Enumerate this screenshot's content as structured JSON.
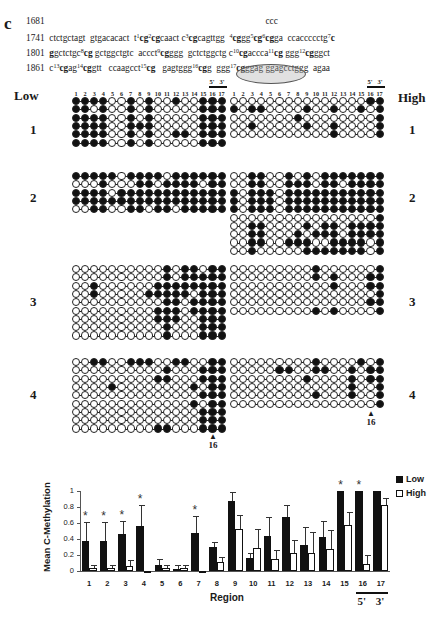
{
  "panel_letter": "c",
  "sequence": {
    "lines": [
      {
        "pos": "1681",
        "html": "                                                                                             ccc"
      },
      {
        "pos": "1741",
        "html": "ctctgctagt  gtgacacact  t<sup>1</sup><b>cg</b><sup>2</sup><b>cg</b>caact c<sup>3</sup><b>cg</b>cagttgg  <sup>4</sup><b>cg</b>gg<sup>5</sup><b>cg</b><sup>6</sup><b>cg</b>ga  ccaccccctg<sup>7</sup><b>c</b>"
      },
      {
        "pos": "1801",
        "html": "<b>g</b>gctctgc<sup>8</sup><b>cg</b> gctggctgtc  accct<sup>9</sup><b>cg</b>ggg  gctctggctg c<sup>10</sup><b>cg</b>accca<sup>11</sup><b>cg</b> ggg<sup>12</sup><b>cg</b>ggct"
      },
      {
        "pos": "1861",
        "html": "c<sup>13</sup><b>cg</b>ag<sup>14</sup><b>cg</b>gtt   ccaagcct<sup>15</sup><b>cg</b>   gagtggg<sup>16</sup><b>cg</b>g  ggg<sup>17</sup><b>cg</b>ggag ggagcctggg  agaa"
      }
    ]
  },
  "labels": {
    "low": "Low",
    "high": "High",
    "five_prime": "5'",
    "three_prime": "3'",
    "arrow_label": "16",
    "arrow": "▲"
  },
  "cpg_numbers": [
    "1",
    "2",
    "3",
    "4",
    "5",
    "6",
    "7",
    "8",
    "9",
    "10",
    "11",
    "12",
    "13",
    "14",
    "15",
    "16",
    "17"
  ],
  "groups": [
    {
      "id": "1",
      "low": [
        "11110010100100111",
        "11010010100000111",
        "11110010100000111",
        "11110011100000111",
        "11110010100110111",
        "11110010100000111"
      ],
      "high": [
        "00000000000000011",
        "10110000100100101",
        "00000001000000001",
        "00100000100100001",
        "00000000000100001"
      ]
    },
    {
      "id": "2",
      "low": [
        "11111011110111111",
        "00010001101111011",
        "11110111111111111",
        "11111111111111111",
        "00110011011011111"
      ],
      "high": [
        "00110010101111111",
        "00110011101101111",
        "10111011111111111",
        "10111011111111111",
        "10111011111111111",
        "00000000000000001",
        "00110000101101111",
        "00110001011101111",
        "00110011100111101",
        "00100000111111101"
      ]
    },
    {
      "id": "3",
      "low": [
        "00000000001011011",
        "00000000001011111",
        "00100000011111111",
        "00100000111110111",
        "00000000001101111",
        "00000000011101111",
        "00000000011100111",
        "00000000001000111",
        "00000000001000111"
      ],
      "high": [
        "00000000010000001",
        "00000000010100011",
        "00000000000100011",
        "00000000000000001",
        "00000000000000011",
        "00000000010100001"
      ]
    },
    {
      "id": "4",
      "low": [
        "00110011100110011",
        "00000000001000111",
        "00000000011000111",
        "00001000000001011",
        "00000000000000111",
        "00000000000001011",
        "00000000000000111",
        "00000000000000111",
        "00000000011000111"
      ],
      "high": [
        "00000000010000101",
        "00000110011001011",
        "00000000100001011",
        "00000000000001001",
        "00000000010001001",
        "00000000000000001"
      ]
    }
  ],
  "chart_data": {
    "type": "bar",
    "title": "",
    "xlabel": "Region",
    "ylabel": "Mean C-Methylation",
    "ylim": [
      0,
      1
    ],
    "yticks": [
      "0",
      "0.2",
      "0.4",
      "0.6",
      "0.8",
      "1"
    ],
    "categories": [
      "1",
      "2",
      "3",
      "4",
      "5",
      "6",
      "7",
      "8",
      "9",
      "10",
      "11",
      "12",
      "13",
      "14",
      "15",
      "16",
      "17"
    ],
    "series": [
      {
        "name": "Low",
        "color": "#111111",
        "values": [
          0.37,
          0.37,
          0.46,
          0.56,
          0.08,
          0.03,
          0.47,
          0.3,
          0.87,
          0.16,
          0.44,
          0.67,
          0.33,
          0.43,
          1.0,
          1.0,
          1.0
        ],
        "errors": [
          0.24,
          0.24,
          0.17,
          0.26,
          0.07,
          0.04,
          0.22,
          0.06,
          0.12,
          0.06,
          0.23,
          0.15,
          0.22,
          0.2,
          0.0,
          0.0,
          0.0
        ]
      },
      {
        "name": "High",
        "color": "#ffffff",
        "values": [
          0.04,
          0.04,
          0.06,
          0.0,
          0.04,
          0.04,
          0.0,
          0.11,
          0.53,
          0.29,
          0.15,
          0.22,
          0.22,
          0.27,
          0.57,
          0.09,
          0.83
        ],
        "errors": [
          0.03,
          0.03,
          0.08,
          0.0,
          0.04,
          0.04,
          0.0,
          0.07,
          0.17,
          0.23,
          0.11,
          0.17,
          0.27,
          0.24,
          0.17,
          0.11,
          0.08
        ]
      }
    ],
    "significant": [
      "1",
      "2",
      "3",
      "4",
      "7",
      "15",
      "16"
    ],
    "annotations": [
      "*"
    ],
    "legend": {
      "position": "top-right",
      "entries": [
        "Low",
        "High"
      ]
    },
    "grid": false,
    "bracket_labels": {
      "16": "5'",
      "17": "3'"
    }
  }
}
